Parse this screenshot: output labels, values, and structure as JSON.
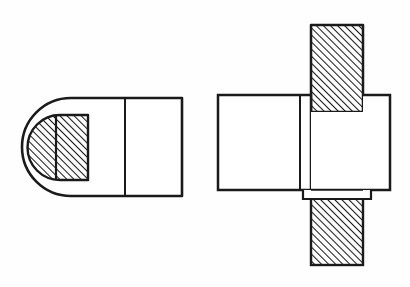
{
  "sheet": {
    "title": "Two-view orthographic section drawing of a machine part",
    "width": 410,
    "height": 287,
    "background_color": "#fefefe",
    "line_color": "#1a1a1a",
    "hatch_color": "#3a3a3a",
    "fill_color": "#ffffff",
    "hatch_angle_deg": 45,
    "hatch_spacing_px": 5,
    "stroke_width_outer": 2.6,
    "stroke_width_inner": 1.8
  },
  "views": [
    {
      "name": "left-view",
      "label": "Left view - rounded end with sectioned boss",
      "body": {
        "name": "outer-profile",
        "x": 26,
        "y": 98,
        "width": 156,
        "height": 98,
        "corner_radius_left": 45,
        "corner_radius_right": 0,
        "fill": "#ffffff"
      },
      "divider": {
        "name": "vertical-divider-line",
        "x": 125,
        "y_top": 98,
        "y_bottom": 196
      },
      "section": {
        "name": "hatched-boss",
        "x": 42,
        "y": 115,
        "width": 46,
        "height": 65,
        "corner_radius_left": 18,
        "hatched": true,
        "inner_divider_x": 56
      }
    },
    {
      "name": "right-view",
      "label": "Right view - body with vertical sectioned shaft",
      "body": {
        "name": "horizontal-body",
        "x": 218,
        "y": 95,
        "width": 172,
        "height": 95,
        "fill": "#ffffff"
      },
      "divider": {
        "name": "vertical-divider-line",
        "x": 300,
        "y_top": 95,
        "y_bottom": 190
      },
      "shaft_upper": {
        "name": "upper-hatched-shaft",
        "x": 311,
        "y": 25,
        "width": 52,
        "height": 87,
        "hatched": true
      },
      "shaft_lower": {
        "name": "lower-hatched-shaft",
        "x": 311,
        "y": 198,
        "width": 52,
        "height": 67,
        "hatched": true
      },
      "shelf": {
        "name": "bottom-step-shelf",
        "x": 303,
        "y": 190,
        "width": 68,
        "height": 8
      },
      "notch": {
        "name": "upper-shaft-notch-line",
        "x_start": 311,
        "x_end": 363,
        "y": 112
      }
    }
  ]
}
